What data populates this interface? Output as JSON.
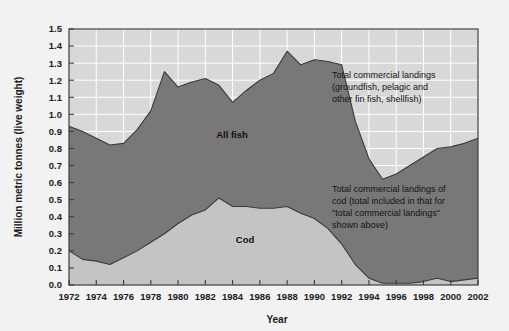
{
  "chart_data": {
    "type": "area",
    "title": "",
    "subtitle": "",
    "xlabel": "Year",
    "ylabel": "Million metric tonnes (live weight)",
    "xlim": [
      1972,
      2002
    ],
    "ylim": [
      0.0,
      1.5
    ],
    "grid": true,
    "legend_position": "in-plot-annotations",
    "x": [
      1972,
      1973,
      1974,
      1975,
      1976,
      1977,
      1978,
      1979,
      1980,
      1981,
      1982,
      1983,
      1984,
      1985,
      1986,
      1987,
      1988,
      1989,
      1990,
      1991,
      1992,
      1993,
      1994,
      1995,
      1996,
      1997,
      1998,
      1999,
      2000,
      2001,
      2002
    ],
    "x_tick_labels": [
      "1972",
      "1974",
      "1976",
      "1978",
      "1980",
      "1982",
      "1984",
      "1986",
      "1988",
      "1990",
      "1992",
      "1994",
      "1996",
      "1998",
      "2000",
      "2002"
    ],
    "y_tick_labels": [
      "0.0",
      "0.1",
      "0.2",
      "0.3",
      "0.4",
      "0.5",
      "0.6",
      "0.7",
      "0.8",
      "0.9",
      "1.0",
      "1.1",
      "1.2",
      "1.3",
      "1.4",
      "1.5"
    ],
    "series": [
      {
        "name": "All fish",
        "label_in_plot": "All fish",
        "color": "#787878",
        "values": [
          0.93,
          0.9,
          0.86,
          0.82,
          0.83,
          0.91,
          1.02,
          1.25,
          1.16,
          1.19,
          1.21,
          1.17,
          1.07,
          1.14,
          1.2,
          1.24,
          1.37,
          1.29,
          1.32,
          1.31,
          1.29,
          0.96,
          0.74,
          0.62,
          0.65,
          0.7,
          0.75,
          0.8,
          0.81,
          0.83,
          0.86
        ]
      },
      {
        "name": "Cod",
        "label_in_plot": "Cod",
        "color": "#c4c4c4",
        "values": [
          0.2,
          0.15,
          0.14,
          0.12,
          0.16,
          0.2,
          0.25,
          0.3,
          0.36,
          0.41,
          0.44,
          0.51,
          0.46,
          0.46,
          0.45,
          0.45,
          0.46,
          0.42,
          0.39,
          0.33,
          0.24,
          0.12,
          0.04,
          0.01,
          0.01,
          0.01,
          0.02,
          0.04,
          0.02,
          0.03,
          0.04
        ]
      }
    ],
    "annotations": [
      {
        "id": "total-landings-note",
        "lines": [
          "Total commercial landings",
          "(groundfish, pelagic and",
          "other fin fish, shellfish)"
        ]
      },
      {
        "id": "cod-landings-note",
        "lines": [
          "Total commercial landings of",
          "cod (total included in that for",
          "\"total commercial landings\"",
          "shown above)"
        ]
      }
    ],
    "colors": {
      "page_background": "#f2f2f2",
      "plot_background": "#d8d8d8",
      "gridline": "#ffffff",
      "axis_line": "#3c3c3c",
      "all_fish_fill": "#787878",
      "cod_fill": "#c4c4c4",
      "curve_stroke": "#3a3a3a",
      "text": "#141414"
    }
  }
}
